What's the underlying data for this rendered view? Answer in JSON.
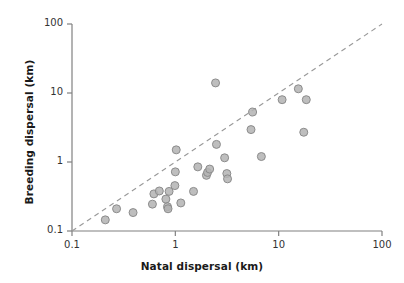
{
  "chart_data": {
    "type": "scatter",
    "title": "",
    "xlabel": "Natal dispersal (km)",
    "ylabel": "Breeding dispersal (km)",
    "xscale": "log",
    "yscale": "log",
    "xlim": [
      0.1,
      100
    ],
    "ylim": [
      0.1,
      100
    ],
    "xticks": [
      "0.1",
      "1",
      "10",
      "100"
    ],
    "yticks": [
      "0.1",
      "1",
      "10",
      "100"
    ],
    "xtick_values": [
      0.1,
      1,
      10,
      100
    ],
    "ytick_values": [
      0.1,
      1,
      10,
      100
    ],
    "grid": false,
    "legend": null,
    "marker": {
      "shape": "circle",
      "fill": "#b3b3b3",
      "stroke": "#8c8c8c",
      "radius": 4.0,
      "opacity": 0.85
    },
    "reference_line": {
      "label": "1:1 line",
      "style": "dashed",
      "color": "#999999",
      "from": [
        0.1,
        0.1
      ],
      "to": [
        100,
        100
      ]
    },
    "points": [
      {
        "x": 0.21,
        "y": 0.145
      },
      {
        "x": 0.27,
        "y": 0.21
      },
      {
        "x": 0.39,
        "y": 0.185
      },
      {
        "x": 0.6,
        "y": 0.245
      },
      {
        "x": 0.62,
        "y": 0.345
      },
      {
        "x": 0.7,
        "y": 0.38
      },
      {
        "x": 0.81,
        "y": 0.29
      },
      {
        "x": 0.84,
        "y": 0.225
      },
      {
        "x": 0.85,
        "y": 0.21
      },
      {
        "x": 0.87,
        "y": 0.375
      },
      {
        "x": 0.99,
        "y": 0.455
      },
      {
        "x": 1.0,
        "y": 0.72
      },
      {
        "x": 1.02,
        "y": 1.5
      },
      {
        "x": 1.13,
        "y": 0.255
      },
      {
        "x": 1.5,
        "y": 0.375
      },
      {
        "x": 1.65,
        "y": 0.85
      },
      {
        "x": 2.0,
        "y": 0.64
      },
      {
        "x": 2.05,
        "y": 0.705
      },
      {
        "x": 2.15,
        "y": 0.79
      },
      {
        "x": 2.45,
        "y": 14.0
      },
      {
        "x": 2.5,
        "y": 1.8
      },
      {
        "x": 3.0,
        "y": 1.15
      },
      {
        "x": 3.15,
        "y": 0.68
      },
      {
        "x": 3.2,
        "y": 0.57
      },
      {
        "x": 5.4,
        "y": 2.95
      },
      {
        "x": 5.6,
        "y": 5.3
      },
      {
        "x": 6.8,
        "y": 1.2
      },
      {
        "x": 10.8,
        "y": 8.0
      },
      {
        "x": 15.5,
        "y": 11.5
      },
      {
        "x": 17.5,
        "y": 2.7
      },
      {
        "x": 18.5,
        "y": 8.0
      }
    ]
  },
  "axes": {
    "x_title": "Natal dispersal (km)",
    "y_title": "Breeding dispersal (km)",
    "x_tick_labels": [
      "0.1",
      "1",
      "10",
      "100"
    ],
    "y_tick_labels": [
      "0.1",
      "1",
      "10",
      "100"
    ]
  },
  "colors": {
    "marker_fill": "#b3b3b3",
    "marker_stroke": "#8c8c8c",
    "axis": "#808080",
    "dashed_line": "#999999",
    "text": "#1a1a1a"
  }
}
